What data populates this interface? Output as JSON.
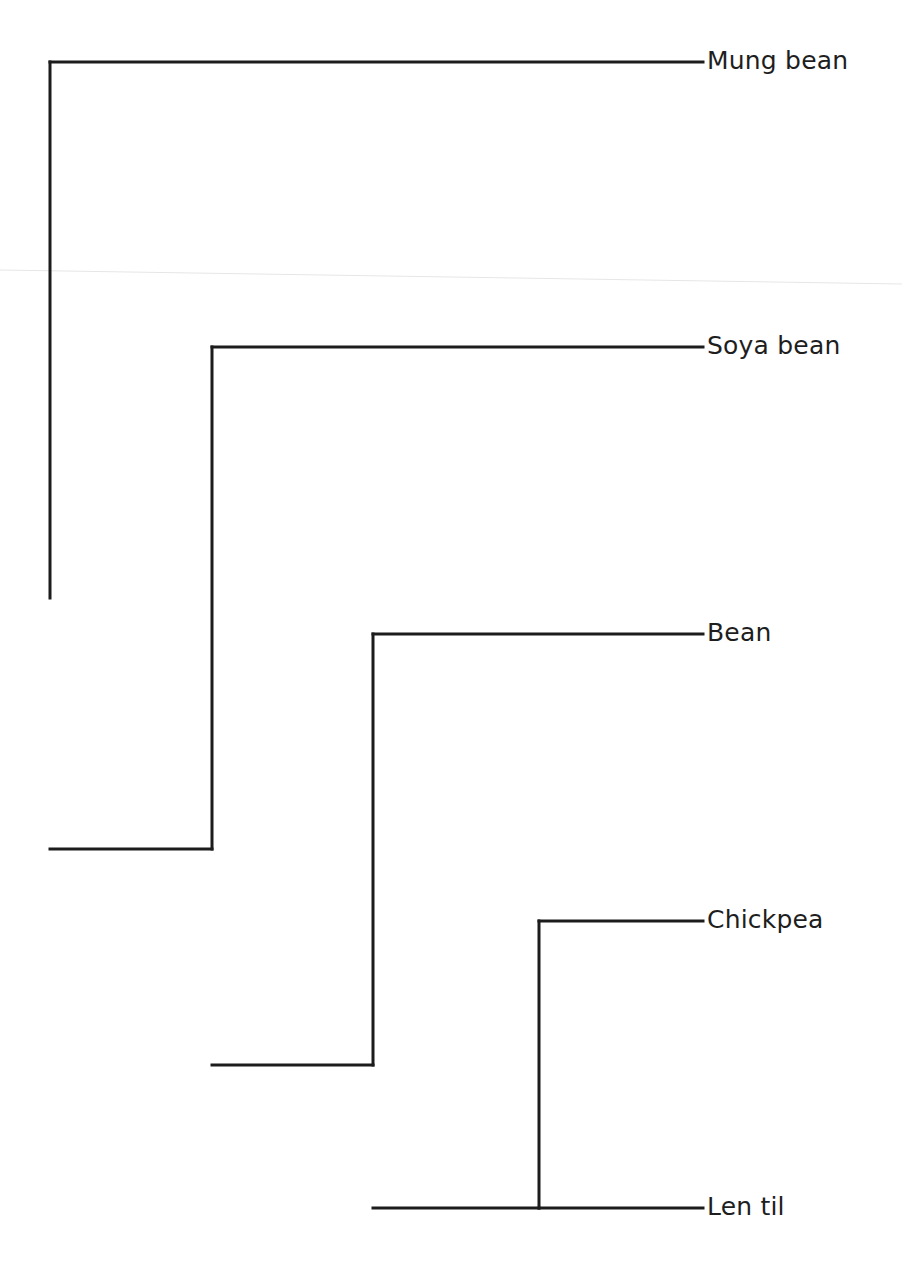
{
  "diagram": {
    "type": "phylogenetic-tree (cladogram)",
    "colors": {
      "line": "#1c1c1c",
      "text": "#1e1e1e",
      "background": "#ffffff"
    },
    "leaves": [
      {
        "id": "mung",
        "label": "Mung bean",
        "y": 62
      },
      {
        "id": "soya",
        "label": "Soya bean",
        "y": 347
      },
      {
        "id": "bean",
        "label": "Bean",
        "y": 634
      },
      {
        "id": "chickpea",
        "label": "Chickpea",
        "y": 921
      },
      {
        "id": "lentil",
        "label": "Len til",
        "y": 1208
      }
    ],
    "leaf_x_end": 703,
    "label_x": 707,
    "nodes": [
      {
        "id": "root",
        "x": 50,
        "y_top": 62,
        "y_bottom": 598,
        "children": [
          "mung",
          "n1"
        ]
      },
      {
        "id": "n1",
        "x": 212,
        "y_top": 347,
        "y_bottom": 849,
        "children": [
          "soya",
          "n2"
        ]
      },
      {
        "id": "n2",
        "x": 373,
        "y_top": 634,
        "y_bottom": 1065,
        "children": [
          "bean",
          "n3"
        ]
      },
      {
        "id": "n3",
        "x": 539,
        "y_top": 921,
        "y_bottom": 1208,
        "children": [
          "chickpea",
          "lentil"
        ]
      }
    ]
  }
}
